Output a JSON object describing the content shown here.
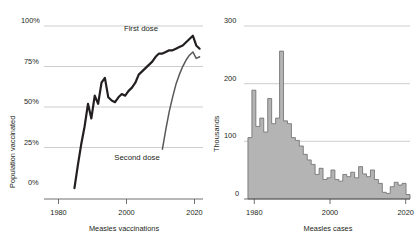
{
  "figure": {
    "background": "#ffffff",
    "text_color": "#231f20",
    "gridline_color": "#b9b9b9",
    "axis_color": "#4c4c4c"
  },
  "chart_data": [
    {
      "id": "measles-vaccinations",
      "type": "line",
      "title": "",
      "xlabel": "Measles vaccinations",
      "ylabel": "Population vaccinated",
      "xlim": [
        1975,
        2022
      ],
      "ylim": [
        0,
        100
      ],
      "xticks": [
        1980,
        2000,
        2020
      ],
      "xtick_labels": [
        "1980",
        "2000",
        "2020"
      ],
      "yticks": [
        0,
        25,
        50,
        75,
        100
      ],
      "ytick_labels": [
        "0%",
        "25%",
        "50%",
        "75%",
        "100%"
      ],
      "grid": true,
      "legend_position": "inline-annotations",
      "colors": {
        "first_dose": "#231f20",
        "second_dose": "#595959"
      },
      "series": [
        {
          "name": "First dose",
          "label": "First dose",
          "color": "#231f20",
          "x": [
            1984,
            1985,
            1986,
            1987,
            1988,
            1989,
            1990,
            1991,
            1992,
            1993,
            1994,
            1995,
            1996,
            1997,
            1998,
            1999,
            2000,
            2001,
            2002,
            2003,
            2004,
            2005,
            2006,
            2007,
            2008,
            2009,
            2010,
            2011,
            2012,
            2013,
            2014,
            2015,
            2016,
            2017,
            2018,
            2019,
            2020,
            2021
          ],
          "values": [
            0,
            14,
            27,
            38,
            52,
            43,
            57,
            52,
            65,
            68,
            56,
            54,
            53,
            56,
            58,
            57,
            60,
            62,
            65,
            70,
            72,
            74,
            76,
            78,
            81,
            83,
            83,
            84,
            85,
            85,
            86,
            87,
            88,
            90,
            92,
            94,
            88,
            86
          ]
        },
        {
          "name": "Second dose",
          "label": "Second dose",
          "color": "#595959",
          "x": [
            2010,
            2011,
            2012,
            2013,
            2014,
            2015,
            2016,
            2017,
            2018,
            2019,
            2020,
            2021
          ],
          "values": [
            24,
            36,
            47,
            56,
            64,
            70,
            75,
            79,
            82,
            84,
            80,
            81
          ]
        }
      ]
    },
    {
      "id": "measles-cases",
      "type": "bar",
      "title": "",
      "xlabel": "Measles cases",
      "ylabel": "Thousands",
      "xlim": [
        1979,
        2021
      ],
      "ylim": [
        0,
        310
      ],
      "xticks": [
        1980,
        2000,
        2020
      ],
      "xtick_labels": [
        "1980",
        "2000",
        "2020"
      ],
      "yticks": [
        0,
        100,
        200,
        300
      ],
      "ytick_labels": [
        "0",
        "100",
        "200",
        "300"
      ],
      "grid": true,
      "bar_fill": "#b4b4b4",
      "bar_stroke": "#6b6b6b",
      "categories": [
        1980,
        1981,
        1982,
        1983,
        1984,
        1985,
        1986,
        1987,
        1988,
        1989,
        1990,
        1991,
        1992,
        1993,
        1994,
        1995,
        1996,
        1997,
        1998,
        1999,
        2000,
        2001,
        2002,
        2003,
        2004,
        2005,
        2006,
        2007,
        2008,
        2009,
        2010,
        2011,
        2012,
        2013,
        2014,
        2015,
        2016,
        2017,
        2018,
        2019,
        2020
      ],
      "values": [
        110,
        195,
        130,
        145,
        120,
        180,
        135,
        145,
        265,
        140,
        135,
        110,
        105,
        95,
        80,
        70,
        62,
        44,
        55,
        35,
        38,
        52,
        35,
        32,
        44,
        40,
        48,
        38,
        58,
        45,
        40,
        52,
        35,
        28,
        12,
        10,
        22,
        30,
        25,
        28,
        8
      ],
      "y_unit": "thousands"
    }
  ]
}
